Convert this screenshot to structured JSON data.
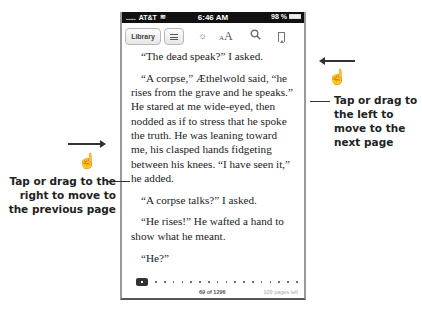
{
  "status_bar": {
    "carrier": "AT&T",
    "signal": ".....",
    "time": "6:46 AM",
    "battery": "98 %"
  },
  "toolbar": {
    "library_label": "Library",
    "toc_icon": "list-icon",
    "brightness_icon": "☼",
    "font_small": "A",
    "font_big": "A",
    "search_icon": "⚲"
  },
  "book": {
    "paragraphs": [
      "“The dead speak?” I asked.",
      "“A corpse,” Æthelwold said, “he rises from the grave and he speaks.” He stared at me wide-eyed, then nodded as if to stress that he spoke the truth. He was leaning toward me, his clasped hands fidgeting between his knees. “I have seen it,” he added.",
      "“A corpse talks?” I asked.",
      "“He rises!” He wafted a hand to show what he meant.",
      "“He?”"
    ]
  },
  "footer": {
    "page_position": "69 of 1296",
    "pages_left": "109 pages left"
  },
  "annotations": {
    "next_page": "Tap or drag to the left to move to the next page",
    "prev_page": "Tap or drag to the right to move to the previous page",
    "hand_glyph": "☝"
  }
}
